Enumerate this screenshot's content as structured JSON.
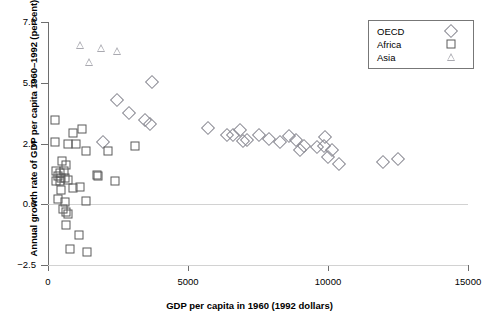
{
  "chart_data": {
    "type": "scatter",
    "title": "",
    "xlabel": "GDP per capita in 1960 (1992 dollars)",
    "ylabel": "Annual growth rate of GDP per capita 1960–1992 (percent)",
    "xlim": [
      0,
      15000
    ],
    "ylim": [
      -2.5,
      7.5
    ],
    "xticks": [
      "0",
      "5000",
      "10000",
      "15000"
    ],
    "xtick_values": [
      0,
      5000,
      10000,
      15000
    ],
    "yticks": [
      "7.5",
      "5.0",
      "2.5",
      "0.0",
      "−2.5"
    ],
    "ytick_values": [
      7.5,
      5.0,
      2.5,
      0.0,
      -2.5
    ],
    "grid": "horizontal reference lines at 0.0 and -2.5",
    "legend_position": "top-right",
    "legend": [
      {
        "name": "OECD",
        "marker": "diamond"
      },
      {
        "name": "Africa",
        "marker": "square"
      },
      {
        "name": "Asia",
        "marker": "triangle"
      }
    ],
    "series": [
      {
        "name": "OECD",
        "marker": "diamond",
        "color": "#8a8a93",
        "points": [
          [
            3700,
            5.05
          ],
          [
            2450,
            4.3
          ],
          [
            2900,
            3.75
          ],
          [
            1950,
            2.55
          ],
          [
            3450,
            3.45
          ],
          [
            3650,
            3.3
          ],
          [
            5700,
            3.15
          ],
          [
            6400,
            2.85
          ],
          [
            6600,
            2.85
          ],
          [
            6850,
            3.05
          ],
          [
            6950,
            2.6
          ],
          [
            7100,
            2.65
          ],
          [
            7550,
            2.85
          ],
          [
            7900,
            2.7
          ],
          [
            8300,
            2.55
          ],
          [
            8600,
            2.8
          ],
          [
            8850,
            2.65
          ],
          [
            9000,
            2.25
          ],
          [
            9150,
            2.4
          ],
          [
            9900,
            2.75
          ],
          [
            9600,
            2.35
          ],
          [
            9850,
            2.4
          ],
          [
            10150,
            2.25
          ],
          [
            10000,
            1.95
          ],
          [
            10400,
            1.65
          ],
          [
            11950,
            1.75
          ],
          [
            12500,
            1.85
          ]
        ]
      },
      {
        "name": "Africa",
        "marker": "square",
        "color": "#5a5a5a",
        "points": [
          [
            250,
            3.45
          ],
          [
            900,
            2.95
          ],
          [
            1200,
            3.1
          ],
          [
            250,
            2.55
          ],
          [
            700,
            2.5
          ],
          [
            1000,
            2.5
          ],
          [
            1350,
            2.2
          ],
          [
            2150,
            2.2
          ],
          [
            3100,
            2.4
          ],
          [
            500,
            1.8
          ],
          [
            650,
            1.6
          ],
          [
            300,
            1.35
          ],
          [
            420,
            1.3
          ],
          [
            560,
            1.35
          ],
          [
            350,
            1.15
          ],
          [
            480,
            1.1
          ],
          [
            600,
            1.1
          ],
          [
            300,
            0.95
          ],
          [
            430,
            0.95
          ],
          [
            700,
            1.0
          ],
          [
            1750,
            1.2
          ],
          [
            1800,
            1.15
          ],
          [
            2400,
            0.95
          ],
          [
            480,
            0.6
          ],
          [
            900,
            0.65
          ],
          [
            1150,
            0.7
          ],
          [
            350,
            0.2
          ],
          [
            620,
            0.1
          ],
          [
            1350,
            0.15
          ],
          [
            520,
            -0.2
          ],
          [
            640,
            -0.3
          ],
          [
            700,
            -0.4
          ],
          [
            640,
            -0.85
          ],
          [
            1100,
            -1.25
          ],
          [
            800,
            -1.85
          ],
          [
            1400,
            -1.95
          ]
        ]
      },
      {
        "name": "Asia",
        "marker": "triangle",
        "color": "#a9a9b0",
        "points": [
          [
            1150,
            6.55
          ],
          [
            1450,
            5.85
          ],
          [
            1900,
            6.45
          ],
          [
            2450,
            6.3
          ]
        ]
      }
    ]
  }
}
